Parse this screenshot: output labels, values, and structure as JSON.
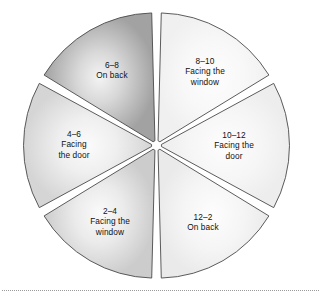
{
  "chart_data": {
    "type": "pie",
    "title": "",
    "subtitle": "",
    "xlabel": "",
    "ylabel": "",
    "legend_position": "none",
    "grid": false,
    "exploded": true,
    "start_angle_deg": 0,
    "categories": [
      "8–10",
      "10–12",
      "12–2",
      "2–4",
      "4–6",
      "6–8"
    ],
    "values": [
      16.67,
      16.67,
      16.67,
      16.67,
      16.67,
      16.67
    ],
    "slices": [
      {
        "range": "8–10",
        "description": "Facing the window",
        "desc_lines": [
          "Facing the",
          "window"
        ],
        "value": 16.67,
        "start_deg": 0,
        "end_deg": 60,
        "fill_outer": "#f2f2f2",
        "fill_inner": "#fdfdfd",
        "label_x": 205,
        "label_y": 72
      },
      {
        "range": "10–12",
        "description": "Facing the door",
        "desc_lines": [
          "Facing the",
          "door"
        ],
        "value": 16.67,
        "start_deg": 60,
        "end_deg": 120,
        "fill_outer": "#efefef",
        "fill_inner": "#fdfdfd",
        "label_x": 234,
        "label_y": 146
      },
      {
        "range": "12–2",
        "description": "On back",
        "desc_lines": [
          "On back"
        ],
        "value": 16.67,
        "start_deg": 120,
        "end_deg": 180,
        "fill_outer": "#ededed",
        "fill_inner": "#fdfdfd",
        "label_x": 203,
        "label_y": 222
      },
      {
        "range": "2–4",
        "description": "Facing the window",
        "desc_lines": [
          "Facing the",
          "window"
        ],
        "value": 16.67,
        "start_deg": 180,
        "end_deg": 240,
        "fill_outer": "#cfcfcf",
        "fill_inner": "#fafafa",
        "label_x": 110,
        "label_y": 222
      },
      {
        "range": "4–6",
        "description": "Facing the door",
        "desc_lines": [
          "Facing",
          "the door"
        ],
        "value": 16.67,
        "start_deg": 240,
        "end_deg": 300,
        "fill_outer": "#d8d8d8",
        "fill_inner": "#fbfbfb",
        "label_x": 74,
        "label_y": 145
      },
      {
        "range": "6–8",
        "description": "On back",
        "desc_lines": [
          "On back"
        ],
        "value": 16.67,
        "start_deg": 300,
        "end_deg": 360,
        "fill_outer": "#a6a6a6",
        "fill_inner": "#f2f2f2",
        "label_x": 112,
        "label_y": 70
      }
    ],
    "colors": {
      "slice_stroke": "#4a4a4a",
      "label_text": "#111111",
      "footer_rule": "#9a9a9a",
      "background": "#ffffff"
    }
  }
}
